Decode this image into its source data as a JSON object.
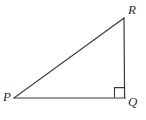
{
  "figure": {
    "type": "geometry-diagram",
    "shape": "right-triangle",
    "background_color": "#ffffff",
    "stroke_color": "#3a3a3a",
    "stroke_width": 1.2,
    "canvas": {
      "width": 146,
      "height": 120
    },
    "labels": {
      "p": "P",
      "q": "Q",
      "r": "R"
    },
    "vertices": [
      {
        "name": "P",
        "x": 14,
        "y": 98
      },
      {
        "name": "Q",
        "x": 125,
        "y": 98
      },
      {
        "name": "R",
        "x": 124,
        "y": 18
      }
    ],
    "sides": [
      {
        "name": "PQ",
        "from": "P",
        "to": "Q"
      },
      {
        "name": "QR",
        "from": "Q",
        "to": "R"
      },
      {
        "name": "PR",
        "from": "P",
        "to": "R"
      }
    ],
    "right_angle": {
      "at_vertex": "Q",
      "marker": "square",
      "marker_size": 10
    }
  }
}
